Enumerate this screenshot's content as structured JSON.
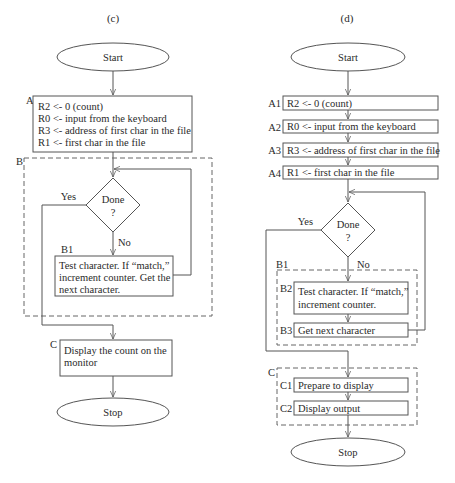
{
  "left": {
    "title": "(c)",
    "start": "Start",
    "stop": "Stop",
    "block_a": {
      "label": "A",
      "lines": [
        "R2 <- 0 (count)",
        "R0 <- input from the keyboard",
        "R3 <- address of first char in the file",
        "R1 <- first char in the file"
      ]
    },
    "block_b": {
      "label": "B"
    },
    "decision": {
      "line1": "Done",
      "line2": "?",
      "yes": "Yes",
      "no": "No"
    },
    "block_b1": {
      "label": "B1",
      "lines": [
        "Test character. If “match,”",
        "increment counter. Get the",
        "next character."
      ]
    },
    "block_c": {
      "label": "C",
      "lines": [
        "Display the count on the",
        "monitor"
      ]
    }
  },
  "right": {
    "title": "(d)",
    "start": "Start",
    "stop": "Stop",
    "steps_a": [
      {
        "label": "A1",
        "text": "R2 <- 0 (count)"
      },
      {
        "label": "A2",
        "text": "R0 <- input from the keyboard"
      },
      {
        "label": "A3",
        "text": "R3 <- address of first char in the file"
      },
      {
        "label": "A4",
        "text": "R1 <- first char in the file"
      }
    ],
    "decision": {
      "line1": "Done",
      "line2": "?",
      "yes": "Yes",
      "no": "No"
    },
    "group_b1": {
      "label": "B1",
      "b2": {
        "label": "B2",
        "lines": [
          "Test character. If “match,”",
          "increment counter."
        ]
      },
      "b3": {
        "label": "B3",
        "text": "Get next character"
      }
    },
    "group_c": {
      "label": "C",
      "c1": {
        "label": "C1",
        "text": "Prepare to display"
      },
      "c2": {
        "label": "C2",
        "text": "Display output"
      }
    }
  }
}
